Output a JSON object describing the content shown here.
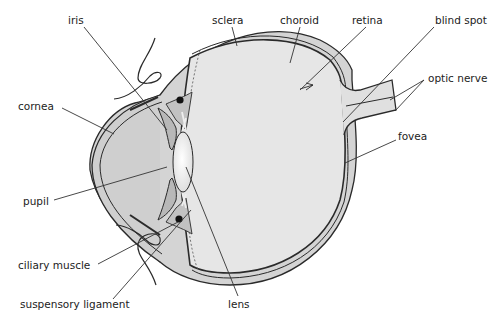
{
  "diagram": {
    "colors": {
      "background": "#ffffff",
      "outline": "#2a2a2a",
      "sclera_fill": "#d4d4d4",
      "vitreous_fill": "#e6e6e6",
      "aqueous_fill": "#cdcdcd",
      "lens_fill": "#f4f4f4",
      "leader_line": "#333333",
      "text": "#222222"
    },
    "labels": {
      "iris": "iris",
      "sclera": "sclera",
      "choroid": "choroid",
      "retina": "retina",
      "blind_spot": "blind spot",
      "optic_nerve": "optic nerve",
      "cornea": "cornea",
      "fovea": "fovea",
      "pupil": "pupil",
      "ciliary_muscle": "ciliary muscle",
      "suspensory_ligament": "suspensory ligament",
      "lens": "lens"
    }
  }
}
